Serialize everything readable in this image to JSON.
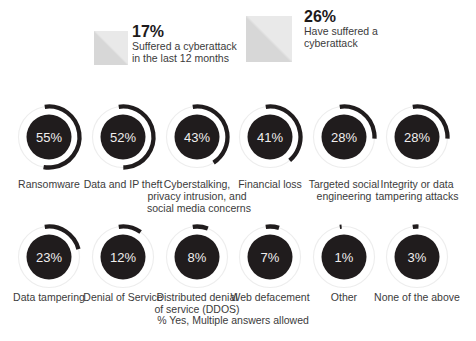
{
  "chart_data": {
    "type": "donut",
    "unit": "%",
    "note": "% Yes, Multiple answers allowed",
    "colors": {
      "gauge_fill": "#201c1d",
      "arc": "#201c1d",
      "track": "#ededed",
      "value_text": "#f0eeee",
      "label_text": "#3b3b3b",
      "legend_value_text": "#1d1a1b",
      "swatch_light": "#e9e9e9",
      "swatch_dark": "#d7d7d7"
    },
    "legend": [
      {
        "value": 17,
        "display": "17%",
        "label": "Suffered a cyberattack in the last 12 months",
        "desc_lines": [
          "Suffered a cyberattack",
          "in the last 12 months"
        ]
      },
      {
        "value": 26,
        "display": "26%",
        "label": "Have suffered a cyberattack",
        "desc_lines": [
          "Have suffered a",
          "cyberattack"
        ]
      }
    ],
    "items": [
      {
        "label": "Ransomware",
        "value": 55,
        "label_lines": [
          "Ransomware"
        ]
      },
      {
        "label": "Data and IP theft",
        "value": 52,
        "label_lines": [
          "Data and IP theft"
        ]
      },
      {
        "label": "Cyberstalking, privacy intrusion, and social media concerns",
        "value": 43,
        "label_lines": [
          "Cyberstalking,",
          "privacy intrusion, and",
          "social media concerns"
        ]
      },
      {
        "label": "Financial loss",
        "value": 41,
        "label_lines": [
          "Financial loss"
        ]
      },
      {
        "label": "Targeted social engineering",
        "value": 28,
        "label_lines": [
          "Targeted social",
          "engineering"
        ]
      },
      {
        "label": "Integrity or data tampering attacks",
        "value": 28,
        "label_lines": [
          "Integrity or data",
          "tampering attacks"
        ]
      },
      {
        "label": "Data tampering",
        "value": 23,
        "label_lines": [
          "Data tampering"
        ]
      },
      {
        "label": "Denial of Service",
        "value": 12,
        "label_lines": [
          "Denial of Service"
        ]
      },
      {
        "label": "Distributed denial of service (DDOS)",
        "value": 8,
        "label_lines": [
          "Distributed denial",
          "of service (DDOS)"
        ]
      },
      {
        "label": "Web defacement",
        "value": 7,
        "label_lines": [
          "Web defacement"
        ]
      },
      {
        "label": "Other",
        "value": 1,
        "label_lines": [
          "Other"
        ]
      },
      {
        "label": "None of the above",
        "value": 3,
        "label_lines": [
          "None of the above"
        ]
      }
    ]
  }
}
